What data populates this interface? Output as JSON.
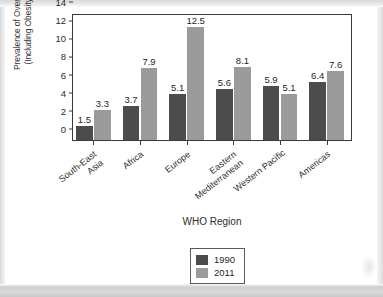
{
  "chart_data": {
    "type": "bar",
    "title": "",
    "xlabel": "WHO Region",
    "ylabel": "Prevalence of Overweight (Including Obesity) (%)",
    "ylabel_line1": "Prevalence of Overweight",
    "ylabel_line2": "(Including Obesity) (%)",
    "categories": [
      "South-East Asia",
      "Africa",
      "Europe",
      "Eastern Mediterranean",
      "Western Pacific",
      "Americas"
    ],
    "category_lines": [
      [
        "South-East",
        "Asia"
      ],
      [
        "Africa"
      ],
      [
        "Europe"
      ],
      [
        "Eastern",
        "Mediterranean"
      ],
      [
        "Western Pacific"
      ],
      [
        "Americas"
      ]
    ],
    "series": [
      {
        "name": "1990",
        "color": "#4c4c4c",
        "values": [
          1.5,
          3.7,
          5.1,
          5.6,
          5.9,
          6.4
        ]
      },
      {
        "name": "2011",
        "color": "#9b9b9b",
        "values": [
          3.3,
          7.9,
          12.5,
          8.1,
          5.1,
          7.6
        ]
      }
    ],
    "ylim": [
      0,
      14
    ],
    "yticks": [
      0,
      2,
      4,
      6,
      8,
      10,
      12,
      14
    ],
    "ytick_labels": [
      "0",
      "2",
      "4",
      "6",
      "8",
      "10",
      "12",
      "14"
    ],
    "grid": false,
    "legend_position": "bottom-center",
    "data_labels": true,
    "value_labels": [
      [
        "1.5",
        "3.3"
      ],
      [
        "3.7",
        "7.9"
      ],
      [
        "5.1",
        "12.5"
      ],
      [
        "5.6",
        "8.1"
      ],
      [
        "5.9",
        "5.1"
      ],
      [
        "6.4",
        "7.6"
      ]
    ]
  },
  "legend": {
    "entries": [
      {
        "label": "1990",
        "color": "#4c4c4c"
      },
      {
        "label": "2011",
        "color": "#9b9b9b"
      }
    ]
  }
}
